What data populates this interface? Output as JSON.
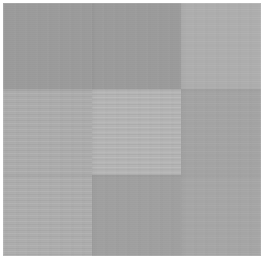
{
  "image": {
    "title": "Gray patch mosaic",
    "description": "A 3 by 3 arrangement of flat gray rectangles of slightly differing lightness on a white background. Several patches carry a faint horizontal banding texture.",
    "width": 265,
    "height": 260,
    "background_color": "#ffffff",
    "margin_px": 3
  },
  "grid": {
    "columns": 3,
    "rows": 3,
    "column_boundaries_px": [
      0,
      89,
      178,
      258
    ],
    "row_boundaries_px": [
      0,
      86,
      172,
      253
    ]
  },
  "patches": [
    {
      "id": "patch-top-left",
      "label": "Top left patch",
      "color": "#9b9b9b",
      "texture": "none",
      "row": 1,
      "column": 1,
      "x": 0,
      "y": 0,
      "width": 178,
      "height": 86,
      "note": "Darkest patch; spans the first two columns of the top row"
    },
    {
      "id": "patch-top-right",
      "label": "Top right patch",
      "color": "#aeaeae",
      "texture": "faint",
      "row": 1,
      "column": 3,
      "x": 178,
      "y": 0,
      "width": 80,
      "height": 86,
      "note": "Lighter than the patch to its left"
    },
    {
      "id": "patch-middle-left",
      "label": "Middle left patch",
      "color": "#acacac",
      "texture": "medium",
      "row": 2,
      "column": 1,
      "x": 0,
      "y": 86,
      "width": 89,
      "height": 86,
      "note": "Horizontal banding clearly visible"
    },
    {
      "id": "patch-middle-center",
      "label": "Middle center patch",
      "color": "#b4b4b4",
      "texture": "strong",
      "row": 2,
      "column": 2,
      "x": 89,
      "y": 86,
      "width": 89,
      "height": 86,
      "note": "Lightest patch; strongest horizontal banding"
    },
    {
      "id": "patch-middle-right",
      "label": "Middle right patch",
      "color": "#a4a4a4",
      "texture": "faint",
      "row": 2,
      "column": 3,
      "x": 178,
      "y": 86,
      "width": 80,
      "height": 86,
      "note": "Medium gray, slightly darker than its neighbours"
    },
    {
      "id": "patch-bottom-left",
      "label": "Bottom left patch",
      "color": "#adadad",
      "texture": "medium",
      "row": 3,
      "column": 1,
      "x": 0,
      "y": 172,
      "width": 89,
      "height": 81,
      "note": "Light with horizontal banding"
    },
    {
      "id": "patch-bottom-center",
      "label": "Bottom center patch",
      "color": "#a0a0a0",
      "texture": "none",
      "row": 3,
      "column": 2,
      "x": 89,
      "y": 172,
      "width": 89,
      "height": 81,
      "note": "Darker flat patch"
    },
    {
      "id": "patch-bottom-right",
      "label": "Bottom right patch",
      "color": "#a6a6a6",
      "texture": "faint",
      "row": 3,
      "column": 3,
      "x": 178,
      "y": 172,
      "width": 80,
      "height": 81,
      "note": "Medium gray"
    }
  ],
  "seams": {
    "vertical_px": [
      89,
      178
    ],
    "horizontal_px": [
      86,
      172
    ]
  }
}
